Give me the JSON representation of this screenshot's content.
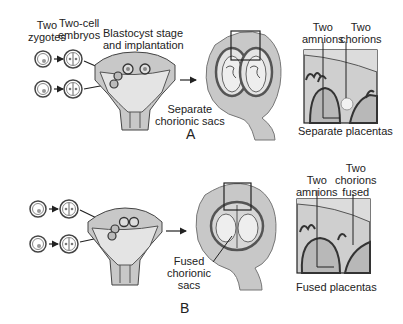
{
  "panel_a": {
    "letter": "A",
    "labels": {
      "two_zygotes": [
        "Two",
        "zygotes"
      ],
      "two_cell_embryos": [
        "Two-cell",
        "embryos"
      ],
      "blastocyst": [
        "Blastocyst stage",
        "and implantation"
      ],
      "sacs": [
        "Separate",
        "chorionic sacs"
      ],
      "two_amnions": [
        "Two",
        "amnions"
      ],
      "two_chorions": [
        "Two",
        "chorions"
      ],
      "placentas": "Separate placentas"
    }
  },
  "panel_b": {
    "letter": "B",
    "labels": {
      "sacs": [
        "Fused",
        "chorionic",
        "sacs"
      ],
      "two_amnions": [
        "Two",
        "amnions"
      ],
      "two_chorions": [
        "Two",
        "chorions",
        "fused"
      ],
      "placentas": "Fused placentas"
    }
  },
  "colors": {
    "tissue": "#c8c8c8",
    "cavity": "#e4e4e4",
    "outline": "#333333",
    "dark": "#555555"
  }
}
